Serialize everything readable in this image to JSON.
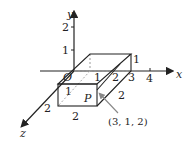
{
  "figure": {
    "type": "3d-coordinate-diagram",
    "axes": {
      "x_label": "x",
      "y_label": "y",
      "z_label": "z",
      "origin_label": "O",
      "x_ticks": [
        "1",
        "2",
        "3",
        "4"
      ],
      "y_ticks": [
        "1",
        "2"
      ],
      "z_ticks": [
        "1",
        "2"
      ]
    },
    "box": {
      "edge_labels": {
        "height_right": "1",
        "depth_right": "2",
        "width_bottom": "2",
        "front_left_depth": "2"
      }
    },
    "point": {
      "label": "P",
      "coordinates": "(3, 1, 2)"
    },
    "colors": {
      "line": "#222222",
      "dashed": "#9a9a9a",
      "arrow_pointer": "#888888"
    }
  }
}
